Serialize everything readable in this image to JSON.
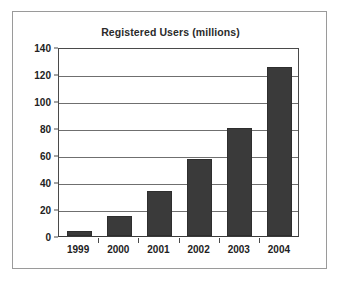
{
  "chart_data": {
    "type": "bar",
    "title": "Registered Users (millions)",
    "xlabel": "",
    "ylabel": "",
    "categories": [
      "1999",
      "2000",
      "2001",
      "2002",
      "2003",
      "2004"
    ],
    "values": [
      4,
      15,
      33,
      57,
      80,
      125
    ],
    "series": [
      {
        "name": "Registered Users (millions)",
        "values": [
          4,
          15,
          33,
          57,
          80,
          125
        ]
      }
    ],
    "ylim": [
      0,
      140
    ],
    "yticks": [
      0,
      20,
      40,
      60,
      80,
      100,
      120,
      140
    ],
    "ytick_labels": [
      "0",
      "20",
      "40",
      "60",
      "80",
      "100",
      "120",
      "140"
    ],
    "grid": "horizontal",
    "legend": "none",
    "bar_color": "#3a3a3a",
    "gridline_color": "#6f6f6f",
    "axis_color": "#4a4a4a",
    "frame_color": "#9a9a9a",
    "background_color": "#ffffff"
  }
}
